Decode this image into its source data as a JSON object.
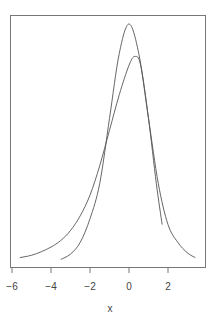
{
  "chart_data": {
    "type": "line",
    "title": "",
    "xlabel": "x",
    "ylabel": "",
    "xlim": [
      -6,
      3.8
    ],
    "ylim": [
      0,
      0.42
    ],
    "grid": false,
    "legend": null,
    "x_ticks": [
      -6,
      -4,
      -2,
      0,
      2
    ],
    "x_tick_labels": [
      "−6",
      "−4",
      "−2",
      "0",
      "2"
    ],
    "y_axis_shown": false,
    "series": [
      {
        "name": "normal density",
        "x": [
          -3.5,
          -3.0,
          -2.5,
          -2.0,
          -1.5,
          -1.0,
          -0.5,
          0.0,
          0.5,
          1.0,
          1.5,
          2.0,
          2.5,
          3.0,
          3.4
        ],
        "y": [
          0.001,
          0.01,
          0.03,
          0.07,
          0.13,
          0.24,
          0.35,
          0.4,
          0.35,
          0.24,
          0.13,
          0.06,
          0.03,
          0.012,
          0.004
        ]
      },
      {
        "name": "estimated density",
        "x": [
          -5.6,
          -5.0,
          -4.5,
          -4.0,
          -3.5,
          -3.0,
          -2.5,
          -2.0,
          -1.5,
          -1.0,
          -0.5,
          0.0,
          0.3,
          0.6,
          1.0,
          1.4,
          1.7
        ],
        "y": [
          0.004,
          0.008,
          0.014,
          0.022,
          0.033,
          0.05,
          0.075,
          0.11,
          0.16,
          0.22,
          0.28,
          0.33,
          0.345,
          0.33,
          0.24,
          0.13,
          0.06
        ]
      }
    ]
  }
}
